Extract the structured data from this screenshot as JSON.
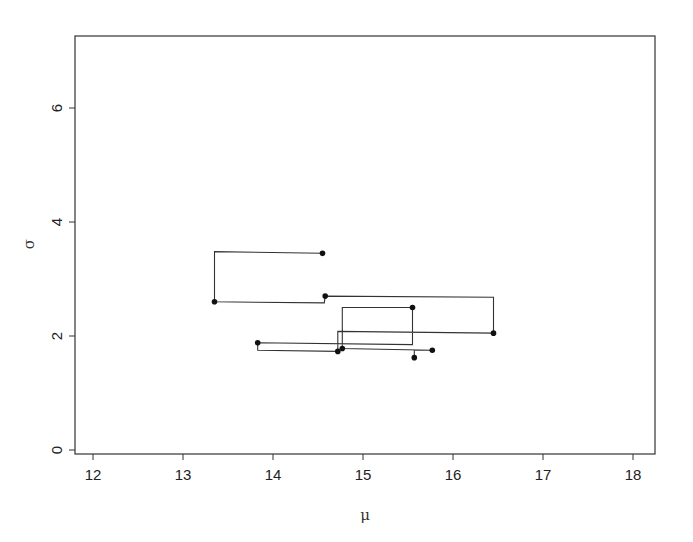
{
  "chart_data": {
    "type": "line",
    "subtype": "step-path-with-points",
    "title": "",
    "xlabel": "μ",
    "ylabel": "σ",
    "xlim": [
      11.8,
      18.25
    ],
    "ylim": [
      -0.3,
      7.2
    ],
    "xticks": [
      12,
      13,
      14,
      15,
      16,
      17,
      18
    ],
    "yticks": [
      0,
      2,
      4,
      6
    ],
    "grid": false,
    "legend": null,
    "path": [
      {
        "mu": 14.55,
        "sigma": 3.45,
        "marker": true
      },
      {
        "mu": 13.35,
        "sigma": 3.48,
        "marker": false
      },
      {
        "mu": 13.35,
        "sigma": 2.6,
        "marker": true
      },
      {
        "mu": 14.57,
        "sigma": 2.58,
        "marker": false
      },
      {
        "mu": 14.58,
        "sigma": 2.7,
        "marker": true
      },
      {
        "mu": 16.45,
        "sigma": 2.68,
        "marker": false
      },
      {
        "mu": 16.45,
        "sigma": 2.05,
        "marker": true
      },
      {
        "mu": 14.72,
        "sigma": 2.08,
        "marker": false
      },
      {
        "mu": 14.72,
        "sigma": 1.73,
        "marker": true
      },
      {
        "mu": 13.83,
        "sigma": 1.75,
        "marker": false
      },
      {
        "mu": 13.83,
        "sigma": 1.88,
        "marker": true
      },
      {
        "mu": 15.55,
        "sigma": 1.85,
        "marker": false
      },
      {
        "mu": 15.55,
        "sigma": 2.5,
        "marker": true
      },
      {
        "mu": 14.77,
        "sigma": 2.5,
        "marker": false
      },
      {
        "mu": 14.77,
        "sigma": 1.78,
        "marker": true
      },
      {
        "mu": 15.77,
        "sigma": 1.75,
        "marker": true
      },
      {
        "mu": 15.57,
        "sigma": 1.75,
        "marker": false
      },
      {
        "mu": 15.57,
        "sigma": 1.62,
        "marker": true
      }
    ],
    "points": [
      {
        "mu": 14.55,
        "sigma": 3.45
      },
      {
        "mu": 13.35,
        "sigma": 2.6
      },
      {
        "mu": 14.58,
        "sigma": 2.7
      },
      {
        "mu": 16.45,
        "sigma": 2.05
      },
      {
        "mu": 15.55,
        "sigma": 2.5
      },
      {
        "mu": 13.83,
        "sigma": 1.88
      },
      {
        "mu": 14.72,
        "sigma": 1.73
      },
      {
        "mu": 14.77,
        "sigma": 1.78
      },
      {
        "mu": 15.77,
        "sigma": 1.75
      },
      {
        "mu": 15.57,
        "sigma": 1.62
      }
    ]
  },
  "colors": {
    "line": "#333333",
    "marker": "#111111",
    "frame": "#333333",
    "background": "#ffffff"
  }
}
